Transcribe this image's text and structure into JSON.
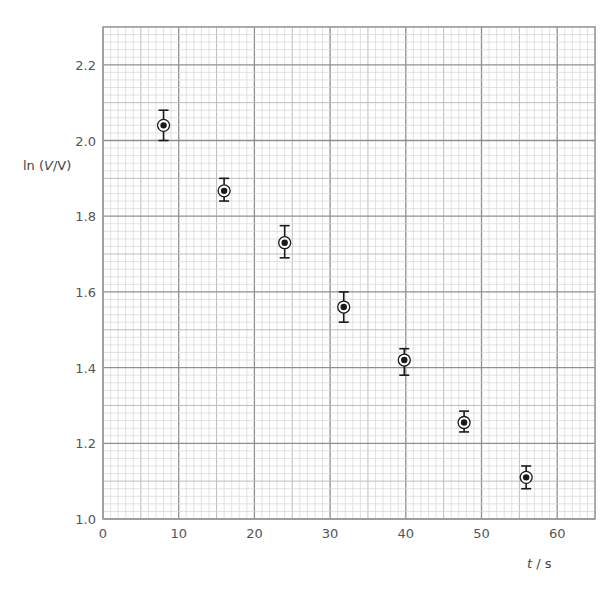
{
  "chart_data": {
    "type": "scatter",
    "title": "",
    "xlabel": "t / s",
    "ylabel": "ln (V/V)",
    "xlim": [
      0,
      65
    ],
    "ylim": [
      1.0,
      2.3
    ],
    "x_ticks": [
      0,
      10,
      20,
      30,
      40,
      50,
      60
    ],
    "y_ticks": [
      "1.0",
      "1.2",
      "1.4",
      "1.6",
      "1.8",
      "2.0",
      "2.2"
    ],
    "grid": {
      "on": true,
      "major_x": 10,
      "medium_x": 5,
      "minor_x": 1,
      "major_y": 0.2,
      "medium_y": 0.1,
      "minor_y": 0.02
    },
    "legend": null,
    "marker": "circled-dot",
    "error_bars": "vertical",
    "series": [
      {
        "name": "data",
        "points": [
          {
            "x": 8.0,
            "y": 2.04,
            "y_err_low": 2.0,
            "y_err_high": 2.08
          },
          {
            "x": 16.0,
            "y": 1.867,
            "y_err_low": 1.84,
            "y_err_high": 1.9
          },
          {
            "x": 24.0,
            "y": 1.73,
            "y_err_low": 1.69,
            "y_err_high": 1.775
          },
          {
            "x": 31.8,
            "y": 1.56,
            "y_err_low": 1.52,
            "y_err_high": 1.6
          },
          {
            "x": 39.8,
            "y": 1.42,
            "y_err_low": 1.38,
            "y_err_high": 1.45
          },
          {
            "x": 47.7,
            "y": 1.255,
            "y_err_low": 1.23,
            "y_err_high": 1.285
          },
          {
            "x": 55.9,
            "y": 1.11,
            "y_err_low": 1.08,
            "y_err_high": 1.14
          }
        ]
      }
    ]
  },
  "colors": {
    "minor_grid": "#d6d6d6",
    "medium_grid": "#bdbdbd",
    "major_grid": "#8f8f8f",
    "frame": "#9a9a9a",
    "marker": "#1a1a1a",
    "text": "#555555"
  },
  "labels": {
    "y_axis": "ln (V/V)",
    "x_axis": "t / s"
  }
}
